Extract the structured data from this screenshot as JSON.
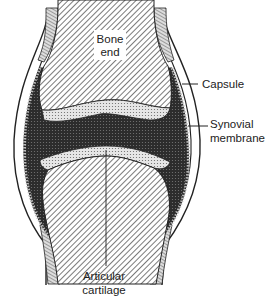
{
  "diagram": {
    "labels": {
      "bone_end_line1": "Bone",
      "bone_end_line2": "end",
      "capsule": "Capsule",
      "synovial_line1": "Synovial",
      "synovial_line2": "membrane",
      "articular_line1": "Articular",
      "articular_line2": "cartilage"
    },
    "colors": {
      "ink": "#222222",
      "cavity": "#3a3a3a",
      "cartilage": "#d9d9d9",
      "background": "#ffffff"
    }
  }
}
